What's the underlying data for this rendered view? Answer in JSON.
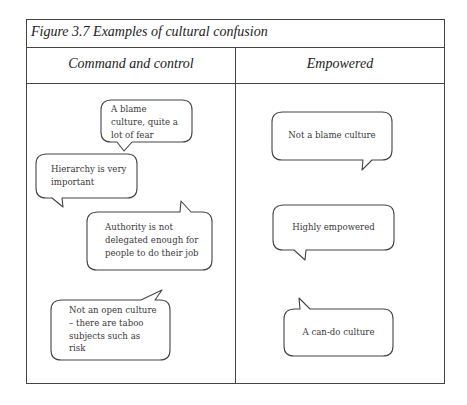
{
  "figure": {
    "title": "Figure 3.7   Examples of cultural confusion",
    "columns": [
      {
        "heading": "Command and control",
        "bubbles": [
          {
            "text": "A blame culture, quite a lot of fear",
            "lines": [
              "A blame",
              "culture, quite a",
              "lot of fear"
            ],
            "tail": "bottom-left"
          },
          {
            "text": "Hierarchy is very important",
            "lines": [
              "Hierarchy is very",
              "important"
            ],
            "tail": "bottom-left"
          },
          {
            "text": "Authority is not delegated enough for people to do their job",
            "lines": [
              "Authority is not",
              "delegated enough for",
              "people to do their job"
            ],
            "tail": "top-right"
          },
          {
            "text": "Not an open culture – there are taboo subjects such as risk",
            "lines": [
              "Not an open culture",
              "– there are taboo",
              "subjects such as",
              "risk"
            ],
            "tail": "top-right"
          }
        ]
      },
      {
        "heading": "Empowered",
        "bubbles": [
          {
            "text": "Not a blame culture",
            "lines": [
              "Not a blame culture"
            ],
            "tail": "bottom-right"
          },
          {
            "text": "Highly empowered",
            "lines": [
              "Highly empowered"
            ],
            "tail": "bottom-left"
          },
          {
            "text": "A can-do culture",
            "lines": [
              "A can-do culture"
            ],
            "tail": "top-left"
          }
        ]
      }
    ]
  },
  "colors": {
    "border": "#444444",
    "text": "#3a3a3a",
    "background": "#ffffff"
  }
}
